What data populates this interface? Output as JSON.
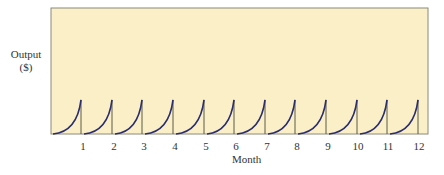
{
  "chart_data": {
    "type": "line",
    "title": "",
    "xlabel": "Month",
    "ylabel": "Output ($)",
    "ylabel_lines": [
      "Output",
      "($)"
    ],
    "categories": [
      "1",
      "2",
      "3",
      "4",
      "5",
      "6",
      "7",
      "8",
      "9",
      "10",
      "11",
      "12"
    ],
    "series": [
      {
        "name": "Monthly output (sawtooth, resets each month)",
        "pattern": "within each month output rises convexly from 0 to a peak, then drops to 0 at the month boundary",
        "peak_values": [
          1,
          1,
          1,
          1,
          1,
          1,
          1,
          1,
          1,
          1,
          1,
          1
        ]
      }
    ],
    "ylim": [
      0,
      3.7
    ],
    "grid": false,
    "legend": null,
    "colors": {
      "plot_bg": "#fbefc8",
      "frame": "#8a8a7a",
      "curve": "#2a2d6e",
      "tick_line": "#5a5a4a"
    }
  }
}
